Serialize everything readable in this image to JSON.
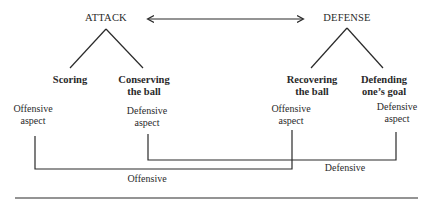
{
  "diagram": {
    "roots": [
      {
        "id": "attack",
        "label": "ATTACK"
      },
      {
        "id": "defense",
        "label": "DEFENSE"
      }
    ],
    "relation": {
      "from": "ATTACK",
      "to": "DEFENSE",
      "type": "bidirectional-arrow"
    },
    "goals": [
      {
        "parent": "ATTACK",
        "line1": "Scoring",
        "line2": ""
      },
      {
        "parent": "ATTACK",
        "line1": "Conserving",
        "line2": "the ball"
      },
      {
        "parent": "DEFENSE",
        "line1": "Recovering",
        "line2": "the ball"
      },
      {
        "parent": "DEFENSE",
        "line1": "Defending",
        "line2": "one’s goal"
      }
    ],
    "aspects": [
      {
        "under": "Scoring",
        "line1": "Offensive",
        "line2": "aspect"
      },
      {
        "under": "Conserving the ball",
        "line1": "Defensive",
        "line2": "aspect"
      },
      {
        "under": "Recovering the ball",
        "line1": "Offensive",
        "line2": "aspect"
      },
      {
        "under": "Defending one’s goal",
        "line1": "Defensive",
        "line2": "aspect"
      }
    ],
    "brackets": [
      {
        "label": "Defensive",
        "connects": [
          "Conserving the ball",
          "Defending one’s goal"
        ]
      },
      {
        "label": "Offensive",
        "connects": [
          "Scoring",
          "Recovering the ball"
        ]
      }
    ]
  }
}
